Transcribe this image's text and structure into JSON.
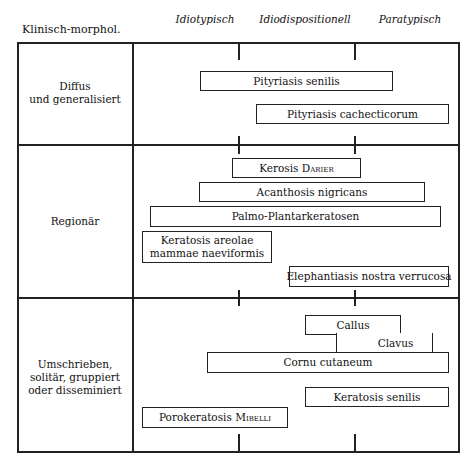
{
  "header": {
    "row_label_column": "Klinisch-morphol.",
    "columns": [
      "Idiotypisch",
      "Idiodispositionell",
      "Paratypisch"
    ]
  },
  "sections": [
    {
      "label_lines": [
        "Diffus",
        "und generalisiert"
      ],
      "items": [
        {
          "name": "Pityriasis senilis"
        },
        {
          "name": "Pityriasis cachecticorum"
        }
      ]
    },
    {
      "label_lines": [
        "Regionär"
      ],
      "items": [
        {
          "name": "Kerosis",
          "author": "Darier"
        },
        {
          "name": "Acanthosis nigricans"
        },
        {
          "name": "Palmo-Plantarkeratosen"
        },
        {
          "name_lines": [
            "Keratosis areolae",
            "mammae naeviformis"
          ]
        },
        {
          "name": "Elephantiasis nostra verrucosa"
        }
      ]
    },
    {
      "label_lines": [
        "Umschrieben,",
        "solitär, gruppiert",
        "oder disseminiert"
      ],
      "items": [
        {
          "name": "Callus"
        },
        {
          "name": "Clavus"
        },
        {
          "name": "Cornu cutaneum"
        },
        {
          "name": "Keratosis senilis"
        },
        {
          "name": "Porokeratosis",
          "author": "Mibelli"
        }
      ]
    }
  ]
}
